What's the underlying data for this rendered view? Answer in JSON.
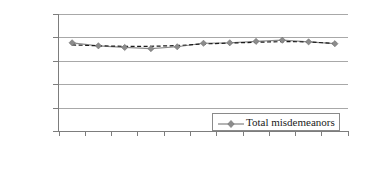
{
  "chart_data": {
    "type": "line",
    "title": "",
    "subtitle": "",
    "xlabel": "",
    "ylabel": "",
    "categories": [
      "2002",
      "2003",
      "2004",
      "2005",
      "2006",
      "2007",
      "2008",
      "2009",
      "2010",
      "2011",
      "2012"
    ],
    "series": [
      {
        "name": "Total misdemeanors",
        "style": "solid-gray-diamond-markers",
        "color": "#8c8c8c",
        "marker": "diamond",
        "values": [
          377000,
          364000,
          357000,
          352000,
          360000,
          375000,
          377000,
          383000,
          388000,
          381000,
          373000
        ]
      },
      {
        "name": "Trend",
        "style": "dashed-black",
        "color": "#1a1a1a",
        "marker": "none",
        "values": [
          368000,
          364000,
          362000,
          362000,
          365000,
          372000,
          376000,
          379000,
          382000,
          381000,
          374000
        ]
      }
    ],
    "ylim": [
      0,
      500000
    ],
    "yticks": [
      "0",
      "100000",
      "200000",
      "300000",
      "400000",
      "500000"
    ],
    "ytick_values": [
      0,
      100000,
      200000,
      300000,
      400000,
      500000
    ],
    "grid": "horizontal",
    "legend_position": "bottom-right"
  },
  "legend": {
    "entries": [
      {
        "label": "Total misdemeanors"
      }
    ]
  },
  "axes": {
    "y": {
      "labels": [
        "500000",
        "400000",
        "300000",
        "200000",
        "100000",
        "0"
      ]
    },
    "x": {
      "labels": [
        "2002",
        "2003",
        "2004",
        "2005",
        "2006",
        "2007",
        "2008",
        "2009",
        "2010",
        "2011",
        "2012"
      ]
    }
  }
}
